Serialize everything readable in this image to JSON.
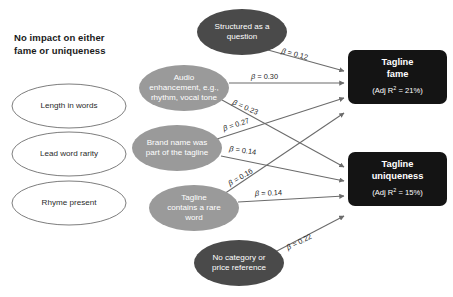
{
  "diagram": {
    "colors": {
      "ellipse_dark": "#4a4a4a",
      "ellipse_gray": "#9a9a9a",
      "ellipse_white_fill": "#ffffff",
      "ellipse_white_stroke": "#6e6e6e",
      "box_fill": "#141414",
      "arrow": "#6b6b6b",
      "text_dark": "#1a1a1a",
      "text_light": "#ffffff",
      "background": "#ffffff"
    },
    "no_impact_group": {
      "heading": "No impact on either fame or uniqueness",
      "heading_lines": [
        "No impact on either",
        "fame or uniqueness"
      ],
      "items": [
        {
          "id": "length-in-words",
          "label": "Length in words",
          "lines": [
            "Length in words"
          ],
          "cx": 69,
          "cy": 106,
          "rx": 57,
          "ry": 22
        },
        {
          "id": "lead-word-rarity",
          "label": "Lead word rarity",
          "lines": [
            "Lead word rarity"
          ],
          "cx": 69,
          "cy": 154,
          "rx": 57,
          "ry": 22
        },
        {
          "id": "rhyme-present",
          "label": "Rhyme present",
          "lines": [
            "Rhyme present"
          ],
          "cx": 69,
          "cy": 203,
          "rx": 57,
          "ry": 22
        }
      ]
    },
    "predictors": [
      {
        "id": "structured-as-a-question",
        "label": "Structured as a question",
        "lines": [
          "Structured as a",
          "question"
        ],
        "shade": "dark",
        "cx": 242,
        "cy": 32,
        "rx": 45,
        "ry": 23
      },
      {
        "id": "audio-enhancement",
        "label": "Audio enhancement, e.g., rhythm, vocal tone",
        "lines": [
          "Audio",
          "enhancement, e.g.,",
          "rhythm, vocal tone"
        ],
        "shade": "gray",
        "cx": 184,
        "cy": 88,
        "rx": 45,
        "ry": 23
      },
      {
        "id": "brand-name-was-part-of-the-tagline",
        "label": "Brand name was part of the tagline",
        "lines": [
          "Brand name was",
          "part of the tagline"
        ],
        "shade": "gray",
        "cx": 177,
        "cy": 148,
        "rx": 45,
        "ry": 23
      },
      {
        "id": "tagline-contains-a-rare-word",
        "label": "Tagline contains a rare word",
        "lines": [
          "Tagline",
          "contains a rare",
          "word"
        ],
        "shade": "gray",
        "cx": 194,
        "cy": 208,
        "rx": 45,
        "ry": 23
      },
      {
        "id": "no-category-or-price-reference",
        "label": "No category or price reference",
        "lines": [
          "No category or",
          "price reference"
        ],
        "shade": "dark",
        "cx": 239,
        "cy": 263,
        "rx": 45,
        "ry": 23
      }
    ],
    "outcomes": [
      {
        "id": "tagline-fame",
        "title": "Tagline fame",
        "title_lines": [
          "Tagline",
          "fame"
        ],
        "subtitle": "(Adj R2 = 21%)",
        "sub_prefix": "(Adj R",
        "sub_sup": "2",
        "sub_suffix": " = 21%)",
        "adj_r2": "21%",
        "x": 348,
        "y": 50,
        "w": 99,
        "h": 54
      },
      {
        "id": "tagline-uniqueness",
        "title": "Tagline uniqueness",
        "title_lines": [
          "Tagline",
          "uniqueness"
        ],
        "subtitle": "(Adj R2 = 15%)",
        "sub_prefix": "(Adj R",
        "sub_sup": "2",
        "sub_suffix": " = 15%)",
        "adj_r2": "15%",
        "x": 348,
        "y": 152,
        "w": 99,
        "h": 54
      }
    ],
    "paths": [
      {
        "id": "structured-to-fame",
        "from": "structured-as-a-question",
        "to": "tagline-fame",
        "beta": "β = 0.12",
        "beta_symbol": "β = ",
        "beta_value": "0.12",
        "x1": 268,
        "y1": 50,
        "x2": 344,
        "y2": 71,
        "lx": 281,
        "ly": 53,
        "rot": 15
      },
      {
        "id": "audio-to-fame",
        "from": "audio-enhancement",
        "to": "tagline-fame",
        "beta": "β = 0.30",
        "beta_symbol": "β = ",
        "beta_value": "0.30",
        "x1": 229,
        "y1": 83,
        "x2": 344,
        "y2": 83,
        "lx": 251,
        "ly": 79,
        "rot": 0
      },
      {
        "id": "audio-to-uniqueness",
        "from": "audio-enhancement",
        "to": "tagline-uniqueness",
        "beta": "β = 0.23",
        "beta_symbol": "β = ",
        "beta_value": "0.23",
        "x1": 222,
        "y1": 100,
        "x2": 344,
        "y2": 167,
        "lx": 232,
        "ly": 104,
        "rot": 24
      },
      {
        "id": "brand-to-fame",
        "from": "brand-name-was-part-of-the-tagline",
        "to": "tagline-fame",
        "beta": "β = 0.27",
        "beta_symbol": "β = ",
        "beta_value": "0.27",
        "x1": 217,
        "y1": 139,
        "x2": 344,
        "y2": 98,
        "lx": 224,
        "ly": 131,
        "rot": -18
      },
      {
        "id": "brand-to-uniqueness",
        "from": "brand-name-was-part-of-the-tagline",
        "to": "tagline-uniqueness",
        "beta": "β = 0.14",
        "beta_symbol": "β = ",
        "beta_value": "0.14",
        "x1": 221,
        "y1": 156,
        "x2": 344,
        "y2": 181,
        "lx": 229,
        "ly": 151,
        "rot": 8
      },
      {
        "id": "rare-word-to-fame",
        "from": "tagline-contains-a-rare-word",
        "to": "tagline-fame",
        "beta": "β = 0.16",
        "beta_symbol": "β = ",
        "beta_value": "0.16",
        "x1": 221,
        "y1": 196,
        "x2": 344,
        "y2": 113,
        "lx": 230,
        "ly": 186,
        "rot": -30
      },
      {
        "id": "rare-word-to-uniqueness",
        "from": "tagline-contains-a-rare-word",
        "to": "tagline-uniqueness",
        "beta": "β = 0.14",
        "beta_symbol": "β = ",
        "beta_value": "0.14",
        "x1": 238,
        "y1": 202,
        "x2": 344,
        "y2": 196,
        "lx": 255,
        "ly": 196,
        "rot": -2
      },
      {
        "id": "no-category-to-uniqueness",
        "from": "no-category-or-price-reference",
        "to": "tagline-uniqueness",
        "beta": "β = 0.22",
        "beta_symbol": "β = ",
        "beta_value": "0.22",
        "x1": 275,
        "y1": 252,
        "x2": 344,
        "y2": 216,
        "lx": 288,
        "ly": 250,
        "rot": -26
      }
    ]
  }
}
